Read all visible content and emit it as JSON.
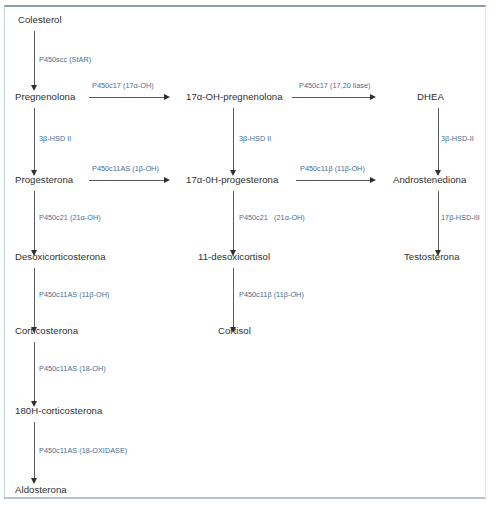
{
  "diagram": {
    "colors": {
      "node_text": "#2f2f2f",
      "enzyme_text": "#4a6d91",
      "arrow": "#5a5a5a",
      "frame_top": "#8d9cad",
      "frame_side": "#c6d2dd"
    },
    "nodes": [
      {
        "id": "colesterol",
        "label": "Colesterol"
      },
      {
        "id": "pregnenolona",
        "label": "Pregnenolona"
      },
      {
        "id": "progesterona",
        "label": "Progesterona"
      },
      {
        "id": "desoxicorticosterona",
        "label": "Desoxicorticosterona"
      },
      {
        "id": "corticosterona",
        "label": "Corticosterona"
      },
      {
        "id": "oh18_corticosterona",
        "label": "180H-corticosterona"
      },
      {
        "id": "aldosterona",
        "label": "Aldosterona"
      },
      {
        "id": "oh17_pregnenolona",
        "label": "17α-OH-pregnenolona"
      },
      {
        "id": "oh17_progesterona",
        "label": "17α-0H-progesterona"
      },
      {
        "id": "desoxicortisol11",
        "label": "11-desoxicortisol"
      },
      {
        "id": "cortisol",
        "label": "Cortisol"
      },
      {
        "id": "dhea",
        "label": "DHEA"
      },
      {
        "id": "androstenediona",
        "label": "Androstenediona"
      },
      {
        "id": "testosterona",
        "label": "Testosterona"
      }
    ],
    "enzymes": [
      {
        "id": "e_scc",
        "label": "P450scc (StAR)"
      },
      {
        "id": "e_3bhsd2_col1",
        "label": "3β-HSD II"
      },
      {
        "id": "e_c21_col1",
        "label": "P450c21 (21α-OH)"
      },
      {
        "id": "e_c11as_11b",
        "label": "P450c11AS (11β-OH)"
      },
      {
        "id": "e_c11as_18oh",
        "label": "P450c11AS (18-OH)"
      },
      {
        "id": "e_c11as_18ox",
        "label": "P450c11AS (18-OXIDASE)"
      },
      {
        "id": "e_c17_17aoh",
        "label": "P450c17 (17α-OH)"
      },
      {
        "id": "e_c11as_1boh",
        "label": "P450c11AS (1β-OH)"
      },
      {
        "id": "e_3bhsd2_col2",
        "label": "3β-HSD II"
      },
      {
        "id": "e_c21_col2",
        "label": "P450c21   (21α-OH)"
      },
      {
        "id": "e_c11b_cortisol",
        "label": "P450c11β (11β-OH)"
      },
      {
        "id": "e_c17_lyase",
        "label": "P450c17 (17,20 liase)"
      },
      {
        "id": "e_c11b_andro",
        "label": "P450c11β (11β-OH)"
      },
      {
        "id": "e_3bhsd2_col4",
        "label": "3β-HSD-II"
      },
      {
        "id": "e_17bhsd3",
        "label": "17β-HSD-III"
      }
    ]
  }
}
